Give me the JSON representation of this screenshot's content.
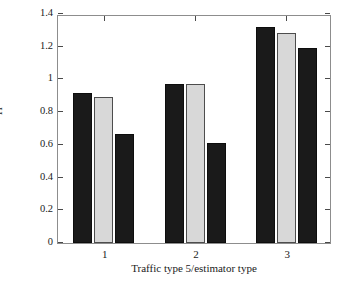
{
  "chart_data": {
    "type": "bar",
    "title": "",
    "xlabel": "Traffic type 5/estimator type",
    "ylabel": "H",
    "categories": [
      "1",
      "2",
      "3"
    ],
    "series": [
      {
        "name": "estimator 1",
        "color": "#1a1a1a",
        "values": [
          0.92,
          0.97,
          1.32
        ]
      },
      {
        "name": "estimator 2",
        "color": "#d8d8d8",
        "values": [
          0.89,
          0.975,
          1.285
        ]
      },
      {
        "name": "estimator 3",
        "color": "#1a1a1a",
        "values": [
          0.665,
          0.61,
          1.19
        ]
      }
    ],
    "ylim": [
      0,
      1.4
    ],
    "ytick_labels": [
      "0",
      "0.2",
      "0.4",
      "0.6",
      "0.8",
      "1",
      "1.2",
      "1.4"
    ],
    "ytick_values": [
      0,
      0.2,
      0.4,
      0.6,
      0.8,
      1.0,
      1.2,
      1.4
    ],
    "xtick_labels": [
      "1",
      "2",
      "3"
    ],
    "grid": false,
    "legend": "none",
    "bar_colors": [
      "#1a1a1a",
      "#d8d8d8",
      "#1a1a1a"
    ],
    "background": "#ffffff",
    "axis_color": "#8d8d8d"
  }
}
